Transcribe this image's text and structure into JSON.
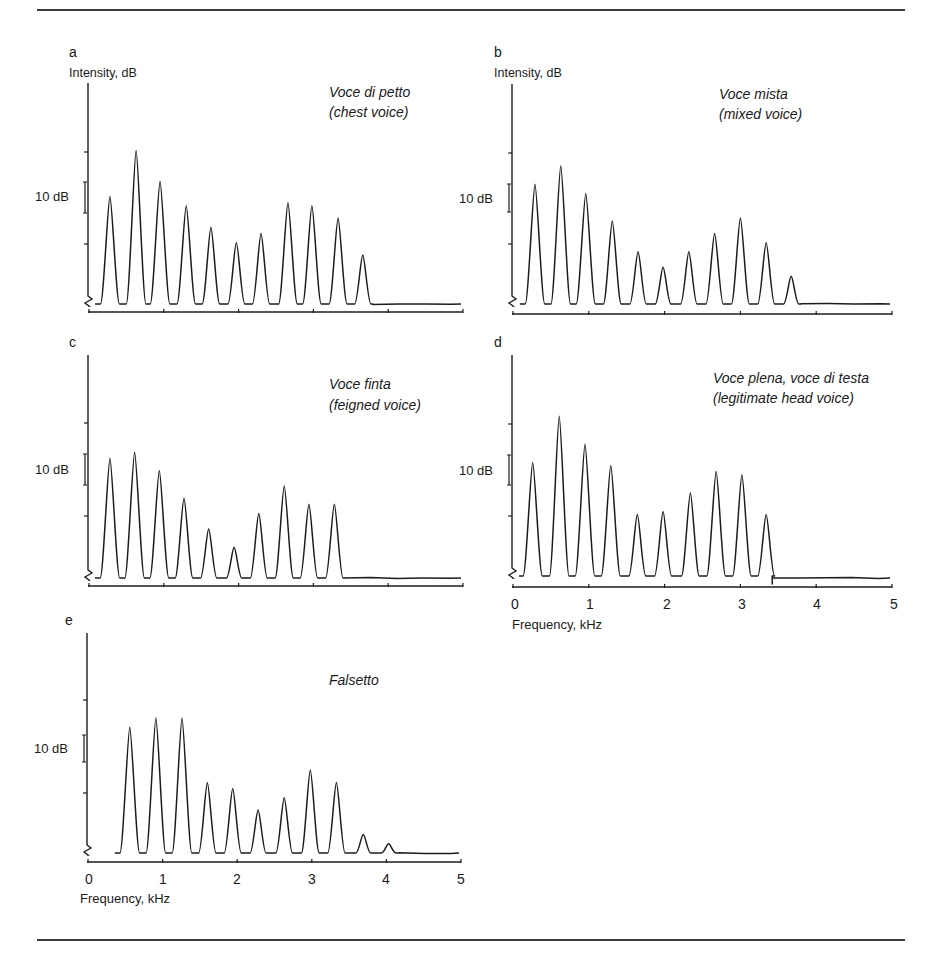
{
  "figure": {
    "y_axis_label": "Intensity, dB",
    "x_axis_label": "Frequency, kHz",
    "scale_bar_label": "10 dB",
    "x_ticks": [
      "0",
      "1",
      "2",
      "3",
      "4",
      "5"
    ]
  },
  "chart_data": [
    {
      "id": "a",
      "type": "line",
      "title": "Voce di petto",
      "subtitle": "(chest voice)",
      "xlabel": "",
      "ylabel": "Intensity, dB",
      "xlim": [
        0,
        5
      ],
      "scale_bar": "10 dB",
      "harmonic_peaks_khz": [
        0.28,
        0.63,
        0.95,
        1.3,
        1.63,
        1.97,
        2.3,
        2.66,
        2.98,
        3.33,
        3.66
      ],
      "harmonic_levels_db": [
        35,
        50,
        40,
        32,
        25,
        20,
        23,
        33,
        32,
        28,
        16
      ]
    },
    {
      "id": "b",
      "type": "line",
      "title": "Voce mista",
      "subtitle": "(mixed voice)",
      "xlabel": "",
      "ylabel": "Intensity, dB",
      "xlim": [
        0,
        5
      ],
      "scale_bar": "10 dB",
      "harmonic_peaks_khz": [
        0.29,
        0.63,
        0.96,
        1.31,
        1.65,
        1.98,
        2.32,
        2.66,
        3.0,
        3.34,
        3.67
      ],
      "harmonic_levels_db": [
        39,
        45,
        36,
        27,
        17,
        12,
        17,
        23,
        28,
        20,
        9
      ]
    },
    {
      "id": "c",
      "type": "line",
      "title": "Voce finta",
      "subtitle": "(feigned voice)",
      "xlabel": "",
      "ylabel": "",
      "xlim": [
        0,
        5
      ],
      "scale_bar": "10 dB",
      "harmonic_peaks_khz": [
        0.28,
        0.61,
        0.94,
        1.27,
        1.6,
        1.94,
        2.27,
        2.61,
        2.94,
        3.28
      ],
      "harmonic_levels_db": [
        39,
        41,
        35,
        26,
        16,
        10,
        21,
        30,
        24,
        24
      ]
    },
    {
      "id": "d",
      "type": "line",
      "title": "Voce plena, voce di testa",
      "subtitle": "(legitimate head voice)",
      "xlabel": "Frequency, kHz",
      "ylabel": "",
      "xlim": [
        0,
        5
      ],
      "x_ticks": [
        0,
        1,
        2,
        3,
        4,
        5
      ],
      "scale_bar": "10 dB",
      "harmonic_peaks_khz": [
        0.26,
        0.61,
        0.95,
        1.29,
        1.64,
        1.98,
        2.34,
        2.68,
        3.02,
        3.34
      ],
      "harmonic_levels_db": [
        37,
        52,
        43,
        36,
        20,
        21,
        27,
        34,
        33,
        20
      ]
    },
    {
      "id": "e",
      "type": "line",
      "title": "Falsetto",
      "subtitle": "",
      "xlabel": "Frequency, kHz",
      "ylabel": "",
      "xlim": [
        0,
        5
      ],
      "x_ticks": [
        0,
        1,
        2,
        3,
        4,
        5
      ],
      "scale_bar": "10 dB",
      "harmonic_peaks_khz": [
        0.56,
        0.91,
        1.26,
        1.6,
        1.94,
        2.28,
        2.63,
        2.98,
        3.33,
        3.69,
        4.03
      ],
      "harmonic_levels_db": [
        41,
        44,
        44,
        23,
        21,
        14,
        18,
        27,
        23,
        6,
        3
      ]
    }
  ]
}
